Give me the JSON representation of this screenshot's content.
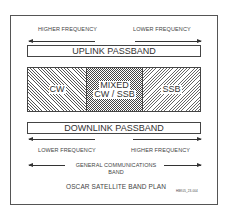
{
  "title": "OSCAR SATELLITE BAND PLAN",
  "top_arrows": {
    "left": "HIGHER FREQUENCY",
    "right": "LOWER FREQUENCY"
  },
  "uplink": "UPLINK PASSBAND",
  "segments": [
    {
      "label": "CW",
      "pattern": "diagonal-hatch"
    },
    {
      "label_line1": "MIXED",
      "label_line2": "CW / SSB",
      "pattern": "checker"
    },
    {
      "label": "SSB",
      "pattern": "diagonal-hatch"
    }
  ],
  "downlink": "DOWNLINK PASSBAND",
  "bottom_arrows": {
    "left": "LOWER FREQUENCY",
    "right": "HIGHER FREQUENCY"
  },
  "general": {
    "line1": "GENERAL COMMUNICATIONS",
    "line2": "BAND"
  },
  "figure_id": "HBK05_23-004"
}
